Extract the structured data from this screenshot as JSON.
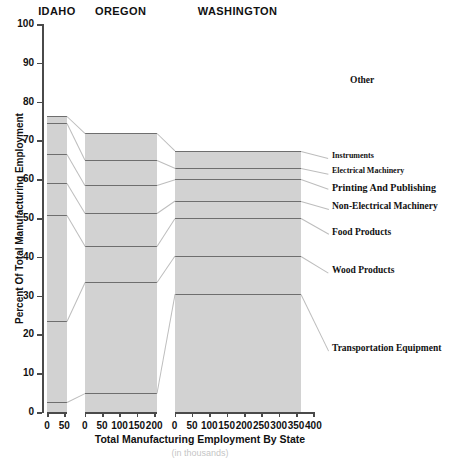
{
  "chart_data": {
    "type": "bar",
    "subtype": "stacked-percent-variable-width",
    "title": "",
    "xlabel": "Total Manufacturing Employment By State",
    "xsublabel": "(in thousands)",
    "ylabel": "Percent Of Total Manufacturing Employment",
    "ylim": [
      0,
      100
    ],
    "yticks": [
      0,
      10,
      20,
      30,
      40,
      50,
      60,
      70,
      80,
      90,
      100
    ],
    "categories": [
      "Transportation Equipment",
      "Wood Products",
      "Food Products",
      "Non-Electrical Machinery",
      "Printing And Publishing",
      "Electrical Machinery",
      "Instruments",
      "Other"
    ],
    "panels": [
      {
        "name": "IDAHO",
        "width_value": 57,
        "xticks": [
          0,
          50
        ],
        "values_percent": [
          2.7,
          20.8,
          27.2,
          8.3,
          7.5,
          8.0,
          1.7,
          23.8
        ],
        "cumulative_percent": [
          2.7,
          23.5,
          50.7,
          59.0,
          66.5,
          74.5,
          76.2,
          100.0
        ]
      },
      {
        "name": "OREGON",
        "width_value": 207,
        "xticks": [
          0,
          50,
          100,
          150,
          200
        ],
        "values_percent": [
          5.0,
          28.5,
          9.3,
          8.5,
          7.2,
          6.5,
          6.8,
          28.2
        ],
        "cumulative_percent": [
          5.0,
          33.5,
          42.8,
          51.3,
          58.5,
          65.0,
          71.8,
          100.0
        ]
      },
      {
        "name": "WASHINGTON",
        "width_value": 363,
        "xticks": [
          0,
          50,
          100,
          150,
          200,
          250,
          300,
          350,
          400
        ],
        "values_percent": [
          30.5,
          9.8,
          9.7,
          4.5,
          5.5,
          3.0,
          4.3,
          32.7
        ],
        "cumulative_percent": [
          30.5,
          40.3,
          50.0,
          54.5,
          60.0,
          63.0,
          67.3,
          100.0
        ]
      }
    ],
    "series_label_positions_percent": [
      16,
      36,
      46,
      52.5,
      57.5,
      61.5,
      65.5,
      85
    ],
    "grid": false,
    "legend": "right-callouts",
    "colors": {
      "segment_fill": "#d2d2d2",
      "other_fill": "#ffffff",
      "segment_border": "#6e6e6e",
      "frame_border": "#9a9a9a",
      "axis": "#4a4a4a",
      "leader_line": "#bdbdbd",
      "text": "#111111"
    }
  }
}
